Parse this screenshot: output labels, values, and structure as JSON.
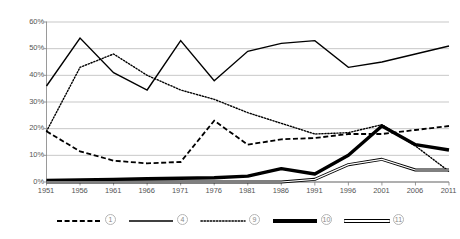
{
  "chart_data": {
    "type": "line",
    "title": "",
    "subtitle": "",
    "xlabel": "",
    "ylabel": "",
    "grid": true,
    "grid_axis": "y",
    "legend_position": "bottom",
    "x": [
      "1951",
      "1956",
      "1961",
      "1966",
      "1971",
      "1976",
      "1981",
      "1986",
      "1991",
      "1996",
      "2001",
      "2006",
      "2011"
    ],
    "categories": [
      "1951",
      "1956",
      "1961",
      "1966",
      "1971",
      "1976",
      "1981",
      "1986",
      "1991",
      "1996",
      "2001",
      "2006",
      "2011"
    ],
    "ylim": [
      0,
      60
    ],
    "ytick_values": [
      0,
      10,
      20,
      30,
      40,
      50,
      60
    ],
    "ytick_labels": [
      "0%",
      "10%",
      "20%",
      "30%",
      "40%",
      "50%",
      "60%"
    ],
    "yunit": "%",
    "series": [
      {
        "name": "①",
        "legend_label": "1",
        "style": "dashed",
        "width": 1.8,
        "color": "#000000",
        "values": [
          19.0,
          11.5,
          8.0,
          7.0,
          7.5,
          23.0,
          14.0,
          16.0,
          16.5,
          18.0,
          18.0,
          19.5,
          21.0
        ]
      },
      {
        "name": "④",
        "legend_label": "4",
        "style": "solid-thin",
        "width": 1.4,
        "color": "#000000",
        "values": [
          36.0,
          54.0,
          41.0,
          34.5,
          53.0,
          38.0,
          49.0,
          52.0,
          53.0,
          43.0,
          45.0,
          48.0,
          51.0
        ]
      },
      {
        "name": "⑨",
        "legend_label": "9",
        "style": "dotted",
        "width": 1.4,
        "color": "#000000",
        "values": [
          19.0,
          43.0,
          48.0,
          40.0,
          34.5,
          31.0,
          26.0,
          22.0,
          18.0,
          18.5,
          21.5,
          13.5,
          4.0
        ]
      },
      {
        "name": "⑩",
        "legend_label": "10",
        "style": "solid-thick",
        "width": 3.4,
        "color": "#000000",
        "values": [
          0.6,
          0.8,
          1.0,
          1.2,
          1.4,
          1.6,
          2.2,
          5.0,
          3.0,
          10.0,
          21.0,
          14.0,
          12.0
        ]
      },
      {
        "name": "⑪",
        "legend_label": "11",
        "style": "double",
        "width": 3.0,
        "color": "#000000",
        "values": [
          0.0,
          0.0,
          0.0,
          0.0,
          0.0,
          0.0,
          0.0,
          0.0,
          1.0,
          6.5,
          8.5,
          4.5,
          4.5
        ]
      }
    ]
  },
  "legend": {
    "items": [
      {
        "label": "1",
        "style": "dashed"
      },
      {
        "label": "4",
        "style": "solid-thin"
      },
      {
        "label": "9",
        "style": "dotted"
      },
      {
        "label": "10",
        "style": "solid-thick"
      },
      {
        "label": "11",
        "style": "double"
      }
    ]
  },
  "axes": {
    "y_labels": [
      "60%",
      "50%",
      "40%",
      "30%",
      "20%",
      "10%",
      "0%"
    ],
    "x_labels": [
      "1951",
      "1956",
      "1961",
      "1966",
      "1971",
      "1976",
      "1981",
      "1986",
      "1991",
      "1996",
      "2001",
      "2006",
      "2011"
    ]
  },
  "colors": {
    "line": "#000000",
    "grid": "#b0b0b0",
    "axis": "#808080",
    "tick_text": "#555555",
    "legend_text": "#8a8a8a",
    "background": "#ffffff"
  }
}
